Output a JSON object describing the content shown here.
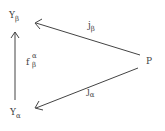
{
  "diagram": {
    "type": "commutative-triangle",
    "nodes": [
      {
        "id": "Y_beta",
        "base": "Y",
        "sub": "β"
      },
      {
        "id": "Y_alpha",
        "base": "Y",
        "sub": "α"
      },
      {
        "id": "P",
        "base": "P"
      }
    ],
    "edges": [
      {
        "from": "P",
        "to": "Y_beta",
        "label": {
          "base": "j",
          "sub": "β"
        }
      },
      {
        "from": "P",
        "to": "Y_alpha",
        "label": {
          "base": "j",
          "sub": "α"
        }
      },
      {
        "from": "Y_alpha",
        "to": "Y_beta",
        "label": {
          "base": "f",
          "sup": "α",
          "sub": "β"
        }
      }
    ],
    "stroke_color": "#444444"
  }
}
